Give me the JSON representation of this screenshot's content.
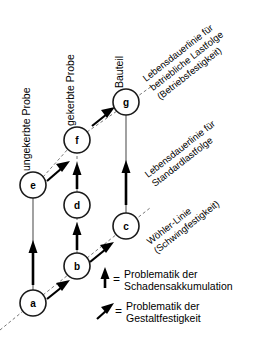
{
  "diagram": {
    "colors": {
      "background": "#ffffff",
      "node_stroke": "#1a1a1a",
      "text": "#000000",
      "thin_edge": "#555555",
      "dashed_edge": "#777777",
      "bold_arrow": "#000000"
    },
    "nodes": [
      {
        "id": "a",
        "label": "a",
        "cx": 33,
        "cy": 303,
        "r": 13
      },
      {
        "id": "b",
        "label": "b",
        "cx": 77,
        "cy": 266,
        "r": 13
      },
      {
        "id": "c",
        "label": "c",
        "cx": 126,
        "cy": 226,
        "r": 13
      },
      {
        "id": "d",
        "label": "d",
        "cx": 77,
        "cy": 205,
        "r": 13
      },
      {
        "id": "e",
        "label": "e",
        "cx": 33,
        "cy": 185,
        "r": 13
      },
      {
        "id": "f",
        "label": "f",
        "cx": 77,
        "cy": 140,
        "r": 13
      },
      {
        "id": "g",
        "label": "g",
        "cx": 126,
        "cy": 102,
        "r": 13
      }
    ],
    "column_labels": [
      {
        "id": "ungekerbte-probe",
        "text": "ungekerbte Probe",
        "x": 30,
        "y": 171,
        "rotation": -90
      },
      {
        "id": "gekerbte-probe",
        "text": "gekerbte Probe",
        "x": 74,
        "y": 126,
        "rotation": -90
      },
      {
        "id": "bauteil",
        "text": "Bauteil",
        "x": 123,
        "y": 88,
        "rotation": -90
      }
    ],
    "diagonal_labels": [
      {
        "id": "lebensdauerlinie-betriebliche",
        "lines": [
          "Lebensdauerlinie für",
          "betriebliche Lastfolge",
          "(Betriebsfestigkeit)"
        ],
        "x": 146,
        "y": 82,
        "rotation": -38
      },
      {
        "id": "lebensdauerlinie-standard",
        "lines": [
          "Lebensdauerlinie für",
          "Standardlastfolge"
        ],
        "x": 148,
        "y": 178,
        "rotation": -38
      },
      {
        "id": "woehler-linie",
        "lines": [
          "Wöhler-Linie",
          "(Schwingfestigkeit)"
        ],
        "x": 150,
        "y": 245,
        "rotation": -38
      }
    ],
    "legend": {
      "equals_sign": "=",
      "entries": [
        {
          "id": "schadensakkumulation",
          "icon": "up-arrow-icon",
          "lines": [
            "Problematik der",
            "Schadensakkumulation"
          ]
        },
        {
          "id": "gestaltfestigkeit",
          "icon": "diagonal-arrow-icon",
          "lines": [
            "Problematik der",
            "Gestaltfestigkeit"
          ]
        }
      ]
    }
  }
}
